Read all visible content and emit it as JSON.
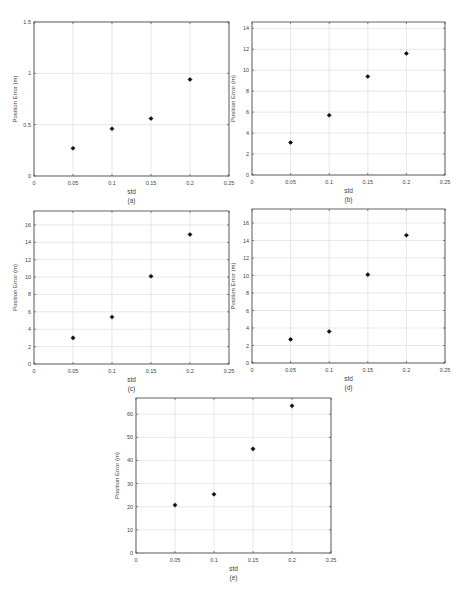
{
  "chart_data": [
    {
      "id": "a",
      "type": "scatter",
      "caption": "(a)",
      "xlabel": "std",
      "ylabel": "Position Error (m)",
      "x": [
        0.05,
        0.1,
        0.15,
        0.2
      ],
      "y": [
        0.27,
        0.46,
        0.56,
        0.94
      ],
      "xlim": [
        0,
        0.25
      ],
      "ylim": [
        0,
        1.5
      ],
      "xticks": [
        0,
        0.05,
        0.1,
        0.15,
        0.2,
        0.25
      ],
      "xtick_labels": [
        "0",
        "0.05",
        "0.1",
        "0.15",
        "0.2",
        "0.25"
      ],
      "yticks": [
        0,
        0.5,
        1,
        1.5
      ],
      "ytick_labels": [
        "0",
        "0.5",
        "1",
        "1.5"
      ],
      "grid": true,
      "marker": "*",
      "box": {
        "left": 34,
        "top": 22,
        "right": 229,
        "bottom": 176
      }
    },
    {
      "id": "b",
      "type": "scatter",
      "caption": "(b)",
      "xlabel": "std",
      "ylabel": "Position Error (m)",
      "x": [
        0.05,
        0.1,
        0.15,
        0.2
      ],
      "y": [
        3.1,
        5.7,
        9.4,
        11.6
      ],
      "xlim": [
        0,
        0.25
      ],
      "ylim": [
        0,
        14.6
      ],
      "xticks": [
        0,
        0.05,
        0.1,
        0.15,
        0.2,
        0.25
      ],
      "xtick_labels": [
        "0",
        "0.05",
        "0.1",
        "0.15",
        "0.2",
        "0.25"
      ],
      "yticks": [
        0,
        2,
        4,
        6,
        8,
        10,
        12,
        14
      ],
      "ytick_labels": [
        "0",
        "2",
        "4",
        "6",
        "8",
        "10",
        "12",
        "14"
      ],
      "grid": true,
      "marker": "*",
      "box": {
        "left": 252,
        "top": 22,
        "right": 445,
        "bottom": 175
      }
    },
    {
      "id": "c",
      "type": "scatter",
      "caption": "(c)",
      "xlabel": "std",
      "ylabel": "Position Error (m)",
      "x": [
        0.05,
        0.1,
        0.15,
        0.2
      ],
      "y": [
        3.0,
        5.4,
        10.1,
        14.9
      ],
      "xlim": [
        0,
        0.25
      ],
      "ylim": [
        0,
        17.6
      ],
      "xticks": [
        0,
        0.05,
        0.1,
        0.15,
        0.2,
        0.25
      ],
      "xtick_labels": [
        "0",
        "0.05",
        "0.1",
        "0.15",
        "0.2",
        "0.25"
      ],
      "yticks": [
        0,
        2,
        4,
        6,
        8,
        10,
        12,
        14,
        16
      ],
      "ytick_labels": [
        "0",
        "2",
        "4",
        "6",
        "8",
        "10",
        "12",
        "14",
        "16"
      ],
      "grid": true,
      "marker": "*",
      "box": {
        "left": 34,
        "top": 211,
        "right": 229,
        "bottom": 364
      }
    },
    {
      "id": "d",
      "type": "scatter",
      "caption": "(d)",
      "xlabel": "std",
      "ylabel": "Position Error (m)",
      "x": [
        0.05,
        0.1,
        0.15,
        0.2
      ],
      "y": [
        2.7,
        3.6,
        10.1,
        14.6
      ],
      "xlim": [
        0,
        0.25
      ],
      "ylim": [
        0,
        17.6
      ],
      "xticks": [
        0,
        0.05,
        0.1,
        0.15,
        0.2,
        0.25
      ],
      "xtick_labels": [
        "0",
        "0.05",
        "0.1",
        "0.15",
        "0.2",
        "0.25"
      ],
      "yticks": [
        0,
        2,
        4,
        6,
        8,
        10,
        12,
        14,
        16
      ],
      "ytick_labels": [
        "0",
        "2",
        "4",
        "6",
        "8",
        "10",
        "12",
        "14",
        "16"
      ],
      "grid": true,
      "marker": "*",
      "box": {
        "left": 252,
        "top": 209,
        "right": 445,
        "bottom": 363
      }
    },
    {
      "id": "e",
      "type": "scatter",
      "caption": "(e)",
      "xlabel": "std",
      "ylabel": "Position Error (m)",
      "x": [
        0.05,
        0.1,
        0.15,
        0.2
      ],
      "y": [
        20.7,
        25.4,
        45.0,
        63.6
      ],
      "xlim": [
        0,
        0.25
      ],
      "ylim": [
        0,
        67
      ],
      "xticks": [
        0,
        0.05,
        0.1,
        0.15,
        0.2,
        0.25
      ],
      "xtick_labels": [
        "0",
        "0.05",
        "0.1",
        "0.15",
        "0.2",
        "0.25"
      ],
      "yticks": [
        0,
        10,
        20,
        30,
        40,
        50,
        60
      ],
      "ytick_labels": [
        "0",
        "10",
        "20",
        "30",
        "40",
        "50",
        "60"
      ],
      "grid": true,
      "marker": "*",
      "box": {
        "left": 136,
        "top": 398,
        "right": 331,
        "bottom": 553
      }
    }
  ],
  "colors": {
    "axis": "#555555",
    "grid": "#d9d9d9",
    "marker": "#111111",
    "text": "#444444"
  }
}
